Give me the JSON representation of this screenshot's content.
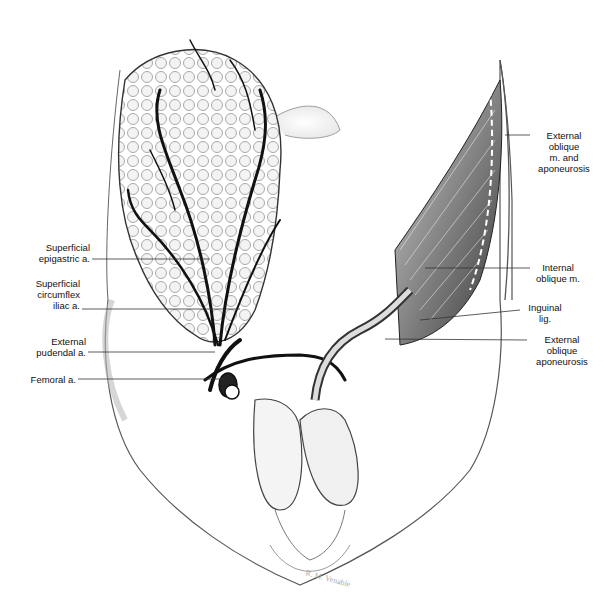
{
  "figure": {
    "signature": "R. M. Venable"
  },
  "labels": {
    "left": [
      {
        "id": "superficial-epigastric",
        "lines": [
          "Superficial",
          "epigastric a."
        ]
      },
      {
        "id": "superficial-circumflex-iliac",
        "lines": [
          "Superficial",
          "circumflex",
          "iliac a."
        ]
      },
      {
        "id": "external-pudendal",
        "lines": [
          "External",
          "pudendal a."
        ]
      },
      {
        "id": "femoral",
        "lines": [
          "Femoral a."
        ]
      }
    ],
    "right": [
      {
        "id": "external-oblique-m",
        "lines": [
          "External",
          "oblique",
          "m. and",
          "aponeurosis"
        ]
      },
      {
        "id": "internal-oblique",
        "lines": [
          "Internal",
          "oblique m."
        ]
      },
      {
        "id": "inguinal-lig",
        "lines": [
          "Inguinal",
          "lig."
        ]
      },
      {
        "id": "external-oblique-aponeurosis",
        "lines": [
          "External",
          "oblique",
          "aponeurosis"
        ]
      }
    ]
  },
  "colors": {
    "ink": "#111111",
    "shade": "#9a9a9a",
    "light": "#d8d8d8",
    "background": "#ffffff"
  }
}
